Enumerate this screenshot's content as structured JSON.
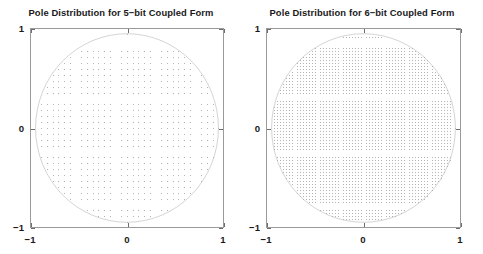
{
  "figure": {
    "background_color": "#ffffff",
    "width": 483,
    "height": 254
  },
  "panels": [
    {
      "id": "left",
      "title": "Pole Distribution for 5−bit Coupled Form",
      "xlabel": "",
      "ylabel": "",
      "x_tick_labels": [
        "−1",
        "0",
        "1"
      ],
      "y_tick_labels": [
        "1",
        "0",
        "−1"
      ]
    },
    {
      "id": "right",
      "title": "Pole Distribution for 6−bit Coupled Form",
      "xlabel": "",
      "ylabel": "",
      "x_tick_labels": [
        "−1",
        "0",
        "1"
      ],
      "y_tick_labels": [
        "1",
        "0",
        "−1"
      ]
    }
  ],
  "chart_data": [
    {
      "type": "scatter",
      "title": "Pole Distribution for 5−bit Coupled Form",
      "xlabel": "",
      "ylabel": "",
      "xlim": [
        -1.05,
        1.05
      ],
      "ylim": [
        -1.05,
        1.05
      ],
      "xticks": [
        -1,
        0,
        1
      ],
      "yticks": [
        -1,
        0,
        1
      ],
      "xtick_labels": [
        "−1",
        "0",
        "1"
      ],
      "ytick_labels": [
        "−1",
        "0",
        "1"
      ],
      "grid": false,
      "legend": null,
      "marker": ".",
      "marker_color": "#b4b4b4",
      "marker_size": 1,
      "description": "All realizable pole locations of a 5-bit coupled-form (Gold-Rader) second-order section: a uniform square lattice of points with quantization step 2^-4 = 0.0625 in both the real and imaginary axes, retained only where the magnitude is <= 1 (inside the unit circle).",
      "quantization_bits": 5,
      "grid_step": 0.0625,
      "grid_points_per_axis": 33,
      "constraint": "x^2 + y^2 <= 1",
      "unit_circle": {
        "drawn": true,
        "radius": 1,
        "center": [
          0,
          0
        ],
        "color": "#b0b0b0"
      }
    },
    {
      "type": "scatter",
      "title": "Pole Distribution for 6−bit Coupled Form",
      "xlabel": "",
      "ylabel": "",
      "xlim": [
        -1.05,
        1.05
      ],
      "ylim": [
        -1.05,
        1.05
      ],
      "xticks": [
        -1,
        0,
        1
      ],
      "yticks": [
        -1,
        0,
        1
      ],
      "xtick_labels": [
        "−1",
        "0",
        "1"
      ],
      "ytick_labels": [
        "−1",
        "0",
        "1"
      ],
      "grid": false,
      "legend": null,
      "marker": ".",
      "marker_color": "#b4b4b4",
      "marker_size": 1,
      "description": "All realizable pole locations of a 6-bit coupled-form (Gold-Rader) second-order section: a uniform square lattice of points with quantization step 2^-5 = 0.03125 in both the real and imaginary axes, retained only where the magnitude is <= 1 (inside the unit circle).",
      "quantization_bits": 6,
      "grid_step": 0.03125,
      "grid_points_per_axis": 65,
      "constraint": "x^2 + y^2 <= 1",
      "unit_circle": {
        "drawn": true,
        "radius": 1,
        "center": [
          0,
          0
        ],
        "color": "#b0b0b0"
      }
    }
  ]
}
